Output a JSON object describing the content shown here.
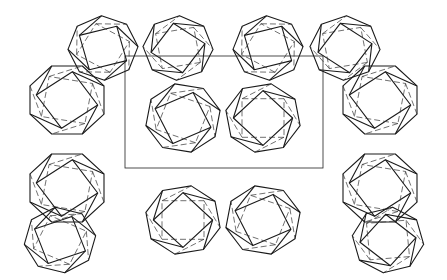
{
  "figure": {
    "type": "crystal-structure-line-drawing",
    "width": 447,
    "height": 280,
    "colors": {
      "background": "#ffffff",
      "line": "#1a1a1a",
      "dashed": "#333333"
    },
    "unit_cell": {
      "x": 125,
      "y": 56,
      "width": 198,
      "height": 112
    },
    "cages": [
      {
        "cx": 67,
        "cy": 100,
        "r": 40,
        "rot": 0
      },
      {
        "cx": 103,
        "cy": 48,
        "r": 35,
        "rot": 20
      },
      {
        "cx": 178,
        "cy": 48,
        "r": 35,
        "rot": -20
      },
      {
        "cx": 183,
        "cy": 118,
        "r": 38,
        "rot": 10
      },
      {
        "cx": 263,
        "cy": 118,
        "r": 38,
        "rot": -10
      },
      {
        "cx": 268,
        "cy": 48,
        "r": 35,
        "rot": 20
      },
      {
        "cx": 345,
        "cy": 48,
        "r": 35,
        "rot": -20
      },
      {
        "cx": 380,
        "cy": 100,
        "r": 40,
        "rot": 0
      },
      {
        "cx": 67,
        "cy": 188,
        "r": 40,
        "rot": 0
      },
      {
        "cx": 60,
        "cy": 240,
        "r": 36,
        "rot": 15
      },
      {
        "cx": 183,
        "cy": 220,
        "r": 38,
        "rot": -10
      },
      {
        "cx": 263,
        "cy": 220,
        "r": 38,
        "rot": 10
      },
      {
        "cx": 380,
        "cy": 188,
        "r": 40,
        "rot": 0
      },
      {
        "cx": 388,
        "cy": 240,
        "r": 36,
        "rot": -15
      }
    ]
  }
}
